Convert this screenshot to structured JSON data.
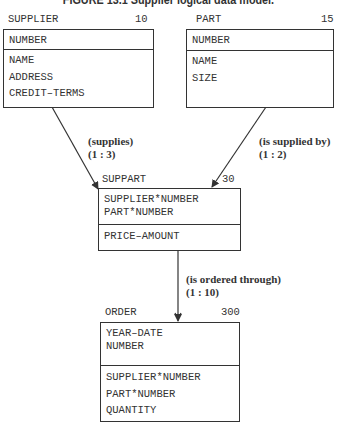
{
  "title": "FIGURE 13.1 Supplier logical data model.",
  "entities": {
    "supplier": {
      "name": "SUPPLIER",
      "count": "10",
      "key_attributes": [
        "NUMBER"
      ],
      "attributes": [
        "NAME",
        "ADDRESS",
        "CREDIT–TERMS"
      ]
    },
    "part": {
      "name": "PART",
      "count": "15",
      "key_attributes": [
        "NUMBER"
      ],
      "attributes": [
        "NAME",
        "SIZE"
      ]
    },
    "suppart": {
      "name": "SUPPART",
      "count": "30",
      "key_attributes": [
        "SUPPLIER*NUMBER",
        "PART*NUMBER"
      ],
      "attributes": [
        "PRICE–AMOUNT"
      ]
    },
    "order": {
      "name": "ORDER",
      "count": "300",
      "key_attributes": [
        "YEAR–DATE",
        "NUMBER"
      ],
      "attributes": [
        "SUPPLIER*NUMBER",
        "PART*NUMBER",
        "QUANTITY"
      ]
    }
  },
  "relationships": {
    "supplies": {
      "label": "(supplies)",
      "cardinality": "(1 : 3)",
      "from": "SUPPLIER",
      "to": "SUPPART"
    },
    "is_supplied_by": {
      "label": "(is supplied by)",
      "cardinality": "(1 : 2)",
      "from": "PART",
      "to": "SUPPART"
    },
    "is_ordered_through": {
      "label": "(is ordered through)",
      "cardinality": "(1 : 10)",
      "from": "SUPPART",
      "to": "ORDER"
    }
  }
}
